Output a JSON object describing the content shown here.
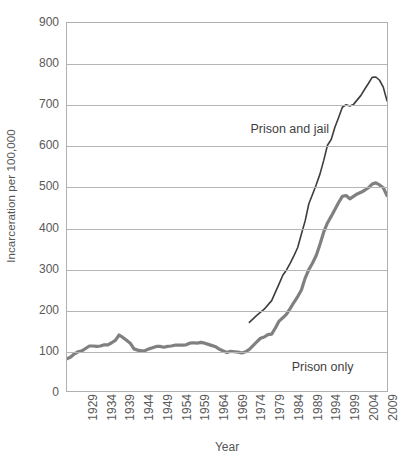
{
  "chart_data": {
    "type": "line",
    "title": "",
    "xlabel": "Year",
    "ylabel": "Incarceration per 100,000",
    "xlim": [
      1925,
      2011
    ],
    "ylim": [
      0,
      900
    ],
    "grid": true,
    "legend_position": "inline-annotations",
    "y_ticks": [
      0,
      100,
      200,
      300,
      400,
      500,
      600,
      700,
      800,
      900
    ],
    "x_ticks": [
      1929,
      1934,
      1939,
      1944,
      1949,
      1954,
      1959,
      1964,
      1969,
      1974,
      1979,
      1984,
      1989,
      1994,
      1999,
      2004,
      2009
    ],
    "series": [
      {
        "name": "Prison and jail",
        "color": "#3d3d3d",
        "width": 1.6,
        "annotation": {
          "text": "Prison and jail",
          "x": 1974,
          "y": 640
        },
        "x": [
          1974,
          1976,
          1978,
          1980,
          1982,
          1983,
          1984,
          1985,
          1986,
          1987,
          1988,
          1989,
          1990,
          1991,
          1992,
          1993,
          1994,
          1995,
          1996,
          1997,
          1998,
          1999,
          2000,
          2001,
          2002,
          2003,
          2004,
          2005,
          2006,
          2007,
          2008,
          2009,
          2010,
          2011
        ],
        "values": [
          168,
          185,
          200,
          221,
          262,
          283,
          296,
          313,
          331,
          351,
          384,
          416,
          458,
          481,
          505,
          531,
          564,
          601,
          615,
          645,
          669,
          694,
          700,
          697,
          701,
          712,
          723,
          738,
          752,
          767,
          768,
          760,
          743,
          710
        ]
      },
      {
        "name": "Prison only",
        "color": "#808080",
        "width": 3.2,
        "annotation": {
          "text": "Prison only",
          "x": 1985,
          "y": 62
        },
        "x": [
          1925,
          1926,
          1927,
          1928,
          1929,
          1930,
          1931,
          1932,
          1933,
          1934,
          1935,
          1936,
          1937,
          1938,
          1939,
          1940,
          1941,
          1942,
          1943,
          1944,
          1945,
          1946,
          1947,
          1948,
          1949,
          1950,
          1951,
          1952,
          1953,
          1954,
          1955,
          1956,
          1957,
          1958,
          1959,
          1960,
          1961,
          1962,
          1963,
          1964,
          1965,
          1966,
          1967,
          1968,
          1969,
          1970,
          1971,
          1972,
          1973,
          1974,
          1975,
          1976,
          1977,
          1978,
          1979,
          1980,
          1981,
          1982,
          1983,
          1984,
          1985,
          1986,
          1987,
          1988,
          1989,
          1990,
          1991,
          1992,
          1993,
          1994,
          1995,
          1996,
          1997,
          1998,
          1999,
          2000,
          2001,
          2002,
          2003,
          2004,
          2005,
          2006,
          2007,
          2008,
          2009,
          2010,
          2011
        ],
        "values": [
          79,
          83,
          91,
          96,
          98,
          104,
          110,
          110,
          109,
          110,
          113,
          113,
          118,
          124,
          137,
          131,
          124,
          117,
          103,
          100,
          98,
          99,
          103,
          106,
          109,
          109,
          107,
          109,
          110,
          112,
          112,
          112,
          113,
          117,
          118,
          117,
          119,
          117,
          114,
          111,
          108,
          102,
          98,
          94,
          97,
          96,
          95,
          93,
          96,
          102,
          111,
          120,
          129,
          132,
          138,
          139,
          154,
          171,
          179,
          188,
          202,
          217,
          231,
          247,
          276,
          297,
          313,
          332,
          359,
          389,
          411,
          427,
          444,
          461,
          476,
          478,
          470,
          476,
          482,
          486,
          491,
          497,
          506,
          509,
          504,
          497,
          478
        ]
      }
    ]
  }
}
